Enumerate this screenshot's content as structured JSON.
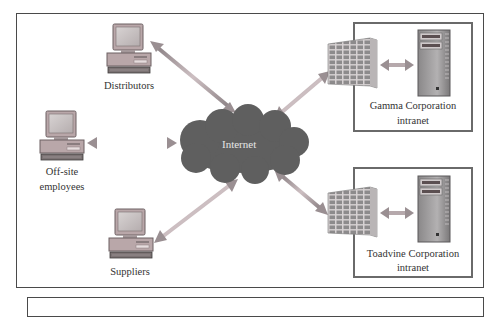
{
  "diagram": {
    "nodes": {
      "distributors": {
        "label": "Distributors",
        "icon": "desktop-computer-icon"
      },
      "offsite": {
        "label_line1": "Off-site",
        "label_line2": "employees",
        "icon": "desktop-computer-icon"
      },
      "suppliers": {
        "label": "Suppliers",
        "icon": "desktop-computer-icon"
      },
      "internet": {
        "label": "Internet",
        "icon": "cloud-icon"
      },
      "gamma": {
        "label_line1": "Gamma Corporation",
        "label_line2": "intranet",
        "firewall_icon": "firewall-icon",
        "server_icon": "server-tower-icon"
      },
      "toadvine": {
        "label_line1": "Toadvine Corporation",
        "label_line2": "intranet",
        "firewall_icon": "firewall-icon",
        "server_icon": "server-tower-icon"
      }
    },
    "connections": [
      {
        "from": "distributors",
        "to": "internet",
        "type": "bidirectional-arrow"
      },
      {
        "from": "offsite",
        "to": "internet",
        "type": "bidirectional-arrow"
      },
      {
        "from": "suppliers",
        "to": "internet",
        "type": "bidirectional-arrow"
      },
      {
        "from": "internet",
        "to": "gamma",
        "type": "bidirectional-arrow"
      },
      {
        "from": "internet",
        "to": "toadvine",
        "type": "bidirectional-arrow"
      },
      {
        "from": "gamma-firewall",
        "to": "gamma-server",
        "type": "bidirectional-arrow"
      },
      {
        "from": "toadvine-firewall",
        "to": "toadvine-server",
        "type": "bidirectional-arrow"
      }
    ],
    "colors": {
      "arrow": "#9a8f92",
      "arrow_light": "#c9b9bd",
      "cloud": "#5f5f5f",
      "computer_body": "#b9a7a9",
      "computer_screen": "#c9c4c4",
      "brick": "#8a8a8a",
      "server": "#9c9a9b",
      "frame": "#4a4a4a"
    }
  }
}
